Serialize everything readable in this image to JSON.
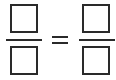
{
  "equation": {
    "left_fraction": {
      "numerator": "",
      "denominator": ""
    },
    "operator": "=",
    "right_fraction": {
      "numerator": "",
      "denominator": ""
    }
  },
  "colors": {
    "stroke": "#2a2a2a",
    "background": "#ffffff"
  }
}
